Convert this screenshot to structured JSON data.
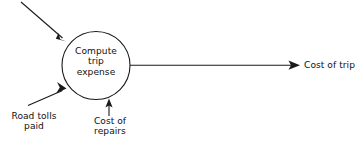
{
  "diagram": {
    "type": "data-flow-diagram",
    "title": "",
    "canvas": {
      "width": 358,
      "height": 146,
      "background": "#ffffff"
    },
    "stroke_color": "#1a1a1a",
    "text_color": "#111111",
    "process": {
      "name": "compute-trip-expense",
      "label_lines": [
        "Compute",
        "trip",
        "expense"
      ],
      "label_text": "Compute\ntrip\nexpense",
      "shape": "circle",
      "cx": 96,
      "cy": 65.5,
      "r": 34
    },
    "flows": [
      {
        "name": "unlabeled-input-top",
        "label": "",
        "direction": "into-process",
        "from": [
          21,
          2
        ],
        "to": [
          66,
          41
        ]
      },
      {
        "name": "road-tolls-paid-input",
        "label_lines": [
          "Road tolls",
          "paid"
        ],
        "label_text": "Road tolls\npaid",
        "direction": "into-process",
        "from": [
          28,
          105
        ],
        "to": [
          66,
          88
        ]
      },
      {
        "name": "cost-of-repairs-input",
        "label_lines": [
          "Cost of",
          "repairs"
        ],
        "label_text": "Cost of\nrepairs",
        "direction": "into-process",
        "from": [
          109,
          116
        ],
        "to": [
          109,
          99
        ]
      },
      {
        "name": "cost-of-trip-output",
        "label_lines": [
          "Cost of trip"
        ],
        "label_text": "Cost of trip",
        "direction": "out-of-process",
        "from": [
          130,
          65
        ],
        "to": [
          300,
          65
        ]
      }
    ]
  }
}
